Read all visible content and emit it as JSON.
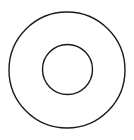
{
  "diagram": {
    "type": "concentric-circles",
    "background": "#ffffff",
    "stroke_color": "#1a1a1a",
    "stroke_width": 1.4,
    "shapes": [
      {
        "name": "outer-circle",
        "cx": 67,
        "cy": 70,
        "r": 58
      },
      {
        "name": "inner-circle",
        "cx": 67.5,
        "cy": 69.5,
        "r": 25
      }
    ]
  }
}
